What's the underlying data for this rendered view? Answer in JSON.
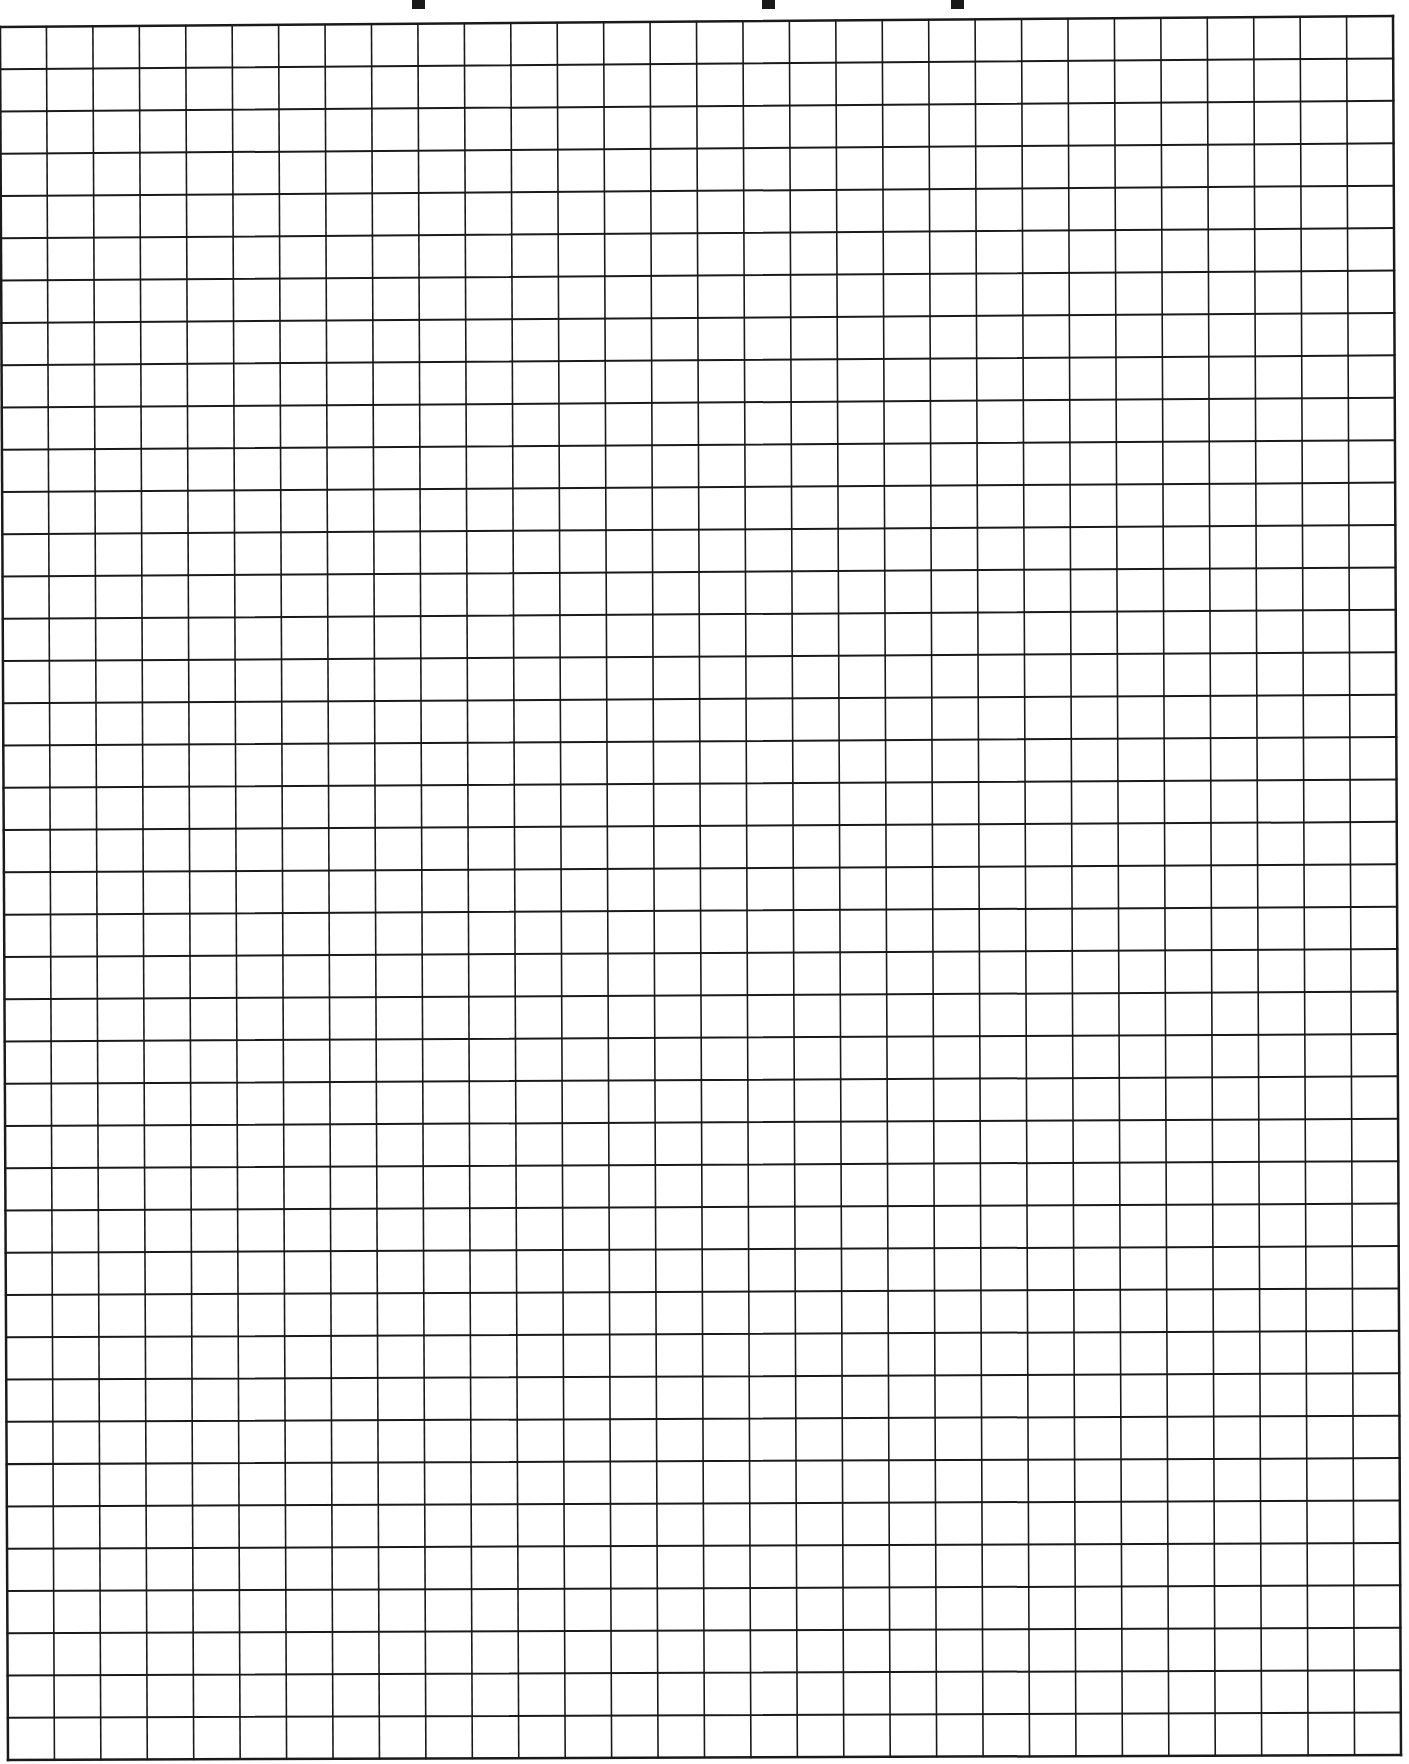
{
  "document": {
    "type": "graph paper",
    "title_visible_fragments": [
      "cropped descender",
      "cropped descender",
      "cropped descender"
    ],
    "title_fragment_positions_x": [
      418,
      768,
      957
    ]
  },
  "grid": {
    "columns": 30,
    "rows": 41,
    "line_color": "#1a1a1a",
    "background_color": "#ffffff",
    "corners": {
      "top_left": [
        0,
        27
      ],
      "top_right": [
        1393,
        16
      ],
      "bottom_left": [
        8,
        1760
      ],
      "bottom_right": [
        1401,
        1755
      ]
    },
    "border_width": 2.5,
    "line_width": 1.6
  }
}
